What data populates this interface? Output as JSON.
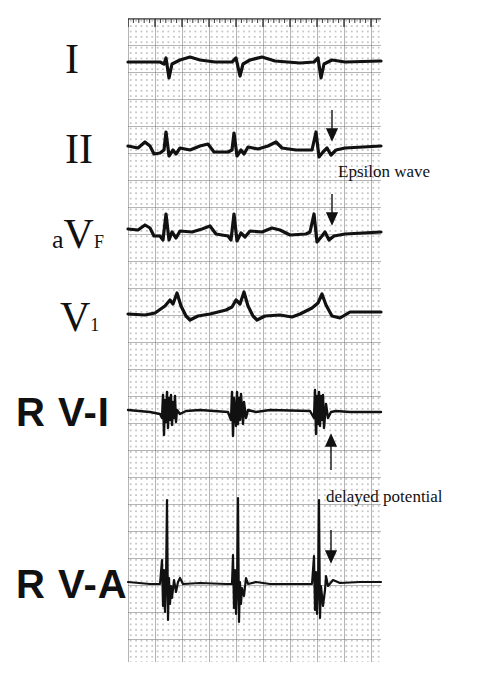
{
  "figure": {
    "leads": [
      {
        "id": "I",
        "label": "I",
        "style": "serif"
      },
      {
        "id": "II",
        "label": "II",
        "style": "serif"
      },
      {
        "id": "aVF",
        "label_prefix": "a",
        "label_main": "V",
        "label_sub": "F",
        "style": "serif"
      },
      {
        "id": "V1",
        "label_main": "V",
        "label_sub": "1",
        "style": "serif"
      },
      {
        "id": "RV-I",
        "label": "R V-I",
        "style": "sans-bold"
      },
      {
        "id": "RV-A",
        "label": "R V-A",
        "style": "sans-bold"
      }
    ],
    "annotations": {
      "epsilon": "Epsilon wave",
      "delayed": "delayed potential"
    },
    "colors": {
      "background": "#ffffff",
      "trace": "#111111",
      "grid": "#8c8c8c"
    },
    "beats_per_strip": 3
  }
}
